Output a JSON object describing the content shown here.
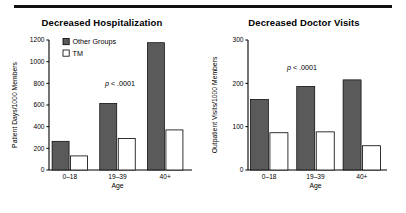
{
  "figure": {
    "background": "#ffffff",
    "rule_color": "#111111",
    "series_colors": {
      "other_groups": "#5a5a5a",
      "tm": "#ffffff",
      "outline": "#000000"
    }
  },
  "panels": [
    {
      "id": "hospitalization",
      "title": "Decreased Hospitalization",
      "annotation": {
        "italic": "p",
        "rest": " < .0001"
      },
      "legend": [
        {
          "label": "Other Groups",
          "swatch": "filled"
        },
        {
          "label": "TM",
          "swatch": "open"
        }
      ],
      "chart_data": {
        "type": "bar",
        "title": "Decreased Hospitalization",
        "xlabel": "Age",
        "ylabel": "Patient Days/1000 Members",
        "categories": [
          "0–18",
          "19–39",
          "40+"
        ],
        "series": [
          {
            "name": "Other Groups",
            "values": [
              265,
              615,
              1175
            ]
          },
          {
            "name": "TM",
            "values": [
              130,
              290,
              370
            ]
          }
        ],
        "ylim": [
          0,
          1200
        ],
        "yticks": [
          0,
          200,
          400,
          600,
          800,
          1000,
          1200
        ],
        "ytick_labels": [
          "0",
          "200",
          "400",
          "600",
          "800",
          "1000",
          "1200"
        ],
        "grid": false,
        "legend_position": "upper left",
        "annotations": [
          "p < .0001"
        ]
      }
    },
    {
      "id": "doctor-visits",
      "title": "Decreased Doctor Visits",
      "annotation": {
        "italic": "p",
        "rest": " < .0001"
      },
      "legend": [],
      "chart_data": {
        "type": "bar",
        "title": "Decreased Doctor Visits",
        "xlabel": "Age",
        "ylabel": "Outpatient Visits/1000 Members",
        "categories": [
          "0–18",
          "19–39",
          "40+"
        ],
        "series": [
          {
            "name": "Other Groups",
            "values": [
              163,
              193,
              208
            ]
          },
          {
            "name": "TM",
            "values": [
              86,
              88,
              56
            ]
          }
        ],
        "ylim": [
          0,
          300
        ],
        "yticks": [
          0,
          100,
          200,
          300
        ],
        "ytick_labels": [
          "0",
          "100",
          "200",
          "300"
        ],
        "grid": false,
        "legend_position": "none",
        "annotations": [
          "p < .0001"
        ]
      }
    }
  ]
}
